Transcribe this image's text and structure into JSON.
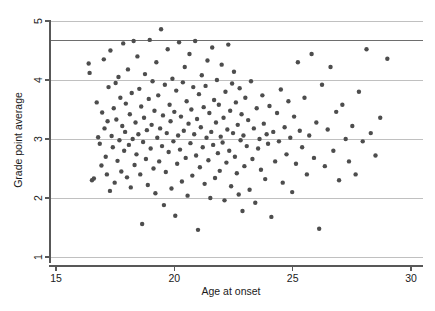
{
  "chart_data": {
    "type": "scatter",
    "title": "",
    "xlabel": "Age at onset",
    "ylabel": "Grade point average",
    "xlim": [
      15,
      30
    ],
    "ylim": [
      1,
      5
    ],
    "xticks": [
      15,
      20,
      25,
      30
    ],
    "yticks": [
      1,
      2,
      3,
      4,
      5
    ],
    "xtick_labels": [
      "15",
      "20",
      "25",
      "30"
    ],
    "ytick_labels": [
      "1",
      "2",
      "3",
      "4",
      "5"
    ],
    "grid": true,
    "grid_axis": "y",
    "legend": "none",
    "marker": "filled-circle",
    "marker_color": "#4d4d4d",
    "marker_size_px": 4.4,
    "reference_lines": [
      {
        "orientation": "horizontal",
        "y": 4.67,
        "color": "#6e6e6e",
        "width": 1.5
      }
    ],
    "series": [
      {
        "name": "students",
        "n_points": 268,
        "points": [
          [
            16.38,
            4.28
          ],
          [
            16.42,
            4.12
          ],
          [
            16.52,
            2.3
          ],
          [
            16.6,
            2.33
          ],
          [
            16.72,
            3.62
          ],
          [
            16.78,
            3.03
          ],
          [
            16.85,
            2.92
          ],
          [
            16.92,
            2.55
          ],
          [
            16.95,
            3.45
          ],
          [
            17.02,
            4.35
          ],
          [
            17.05,
            3.18
          ],
          [
            17.1,
            2.7
          ],
          [
            17.15,
            2.4
          ],
          [
            17.18,
            3.3
          ],
          [
            17.22,
            3.88
          ],
          [
            17.28,
            2.12
          ],
          [
            17.3,
            4.5
          ],
          [
            17.35,
            3.05
          ],
          [
            17.4,
            2.86
          ],
          [
            17.44,
            3.52
          ],
          [
            17.48,
            2.26
          ],
          [
            17.52,
            3.95
          ],
          [
            17.55,
            3.33
          ],
          [
            17.6,
            2.63
          ],
          [
            17.64,
            4.05
          ],
          [
            17.68,
            2.98
          ],
          [
            17.72,
            3.7
          ],
          [
            17.76,
            2.45
          ],
          [
            17.8,
            3.22
          ],
          [
            17.84,
            4.62
          ],
          [
            17.88,
            2.8
          ],
          [
            17.92,
            3.12
          ],
          [
            17.95,
            3.6
          ],
          [
            18.0,
            2.35
          ],
          [
            18.04,
            4.18
          ],
          [
            18.08,
            2.9
          ],
          [
            18.12,
            3.42
          ],
          [
            18.16,
            2.18
          ],
          [
            18.2,
            3.78
          ],
          [
            18.24,
            3.0
          ],
          [
            18.28,
            4.66
          ],
          [
            18.32,
            2.56
          ],
          [
            18.36,
            3.28
          ],
          [
            18.4,
            2.74
          ],
          [
            18.44,
            4.4
          ],
          [
            18.48,
            3.08
          ],
          [
            18.52,
            3.85
          ],
          [
            18.56,
            2.4
          ],
          [
            18.6,
            3.55
          ],
          [
            18.64,
            1.56
          ],
          [
            18.68,
            2.95
          ],
          [
            18.72,
            3.36
          ],
          [
            18.76,
            4.1
          ],
          [
            18.8,
            2.66
          ],
          [
            18.84,
            3.15
          ],
          [
            18.88,
            2.22
          ],
          [
            18.92,
            3.68
          ],
          [
            18.96,
            4.68
          ],
          [
            19.0,
            2.84
          ],
          [
            19.04,
            3.24
          ],
          [
            19.08,
            3.98
          ],
          [
            19.12,
            2.5
          ],
          [
            19.16,
            3.48
          ],
          [
            19.2,
            2.08
          ],
          [
            19.24,
            4.3
          ],
          [
            19.28,
            3.02
          ],
          [
            19.32,
            3.74
          ],
          [
            19.36,
            2.62
          ],
          [
            19.4,
            3.18
          ],
          [
            19.44,
            4.86
          ],
          [
            19.48,
            2.88
          ],
          [
            19.52,
            3.4
          ],
          [
            19.56,
            1.88
          ],
          [
            19.6,
            3.92
          ],
          [
            19.64,
            2.44
          ],
          [
            19.68,
            3.1
          ],
          [
            19.72,
            4.52
          ],
          [
            19.76,
            2.78
          ],
          [
            19.8,
            3.58
          ],
          [
            19.84,
            3.3
          ],
          [
            19.88,
            2.16
          ],
          [
            19.92,
            4.02
          ],
          [
            19.96,
            2.96
          ],
          [
            20.0,
            3.46
          ],
          [
            20.04,
            1.7
          ],
          [
            20.08,
            3.82
          ],
          [
            20.12,
            2.58
          ],
          [
            20.16,
            3.06
          ],
          [
            20.2,
            4.64
          ],
          [
            20.24,
            2.82
          ],
          [
            20.28,
            3.38
          ],
          [
            20.32,
            2.28
          ],
          [
            20.36,
            3.96
          ],
          [
            20.4,
            3.14
          ],
          [
            20.44,
            4.22
          ],
          [
            20.48,
            2.68
          ],
          [
            20.52,
            3.64
          ],
          [
            20.56,
            2.04
          ],
          [
            20.6,
            3.26
          ],
          [
            20.64,
            4.44
          ],
          [
            20.68,
            2.93
          ],
          [
            20.72,
            3.5
          ],
          [
            20.76,
            2.38
          ],
          [
            20.8,
            3.88
          ],
          [
            20.84,
            3.08
          ],
          [
            20.88,
            4.66
          ],
          [
            20.92,
            2.72
          ],
          [
            20.96,
            3.34
          ],
          [
            21.0,
            1.46
          ],
          [
            21.04,
            3.76
          ],
          [
            21.08,
            2.52
          ],
          [
            21.12,
            3.2
          ],
          [
            21.16,
            4.08
          ],
          [
            21.2,
            2.86
          ],
          [
            21.24,
            3.54
          ],
          [
            21.28,
            2.24
          ],
          [
            21.32,
            3.9
          ],
          [
            21.36,
            3.02
          ],
          [
            21.4,
            4.33
          ],
          [
            21.44,
            2.64
          ],
          [
            21.48,
            3.44
          ],
          [
            21.52,
            2.0
          ],
          [
            21.56,
            3.12
          ],
          [
            21.6,
            4.55
          ],
          [
            21.64,
            2.9
          ],
          [
            21.68,
            3.66
          ],
          [
            21.72,
            2.34
          ],
          [
            21.76,
            3.28
          ],
          [
            21.8,
            4.0
          ],
          [
            21.84,
            2.76
          ],
          [
            21.88,
            3.58
          ],
          [
            21.92,
            2.46
          ],
          [
            21.96,
            3.04
          ],
          [
            22.0,
            4.26
          ],
          [
            22.04,
            2.94
          ],
          [
            22.08,
            3.36
          ],
          [
            22.12,
            1.96
          ],
          [
            22.16,
            3.8
          ],
          [
            22.2,
            2.6
          ],
          [
            22.24,
            3.16
          ],
          [
            22.28,
            4.6
          ],
          [
            22.32,
            2.8
          ],
          [
            22.36,
            3.48
          ],
          [
            22.4,
            2.2
          ],
          [
            22.44,
            3.94
          ],
          [
            22.48,
            3.1
          ],
          [
            22.52,
            4.14
          ],
          [
            22.56,
            2.7
          ],
          [
            22.6,
            3.62
          ],
          [
            22.64,
            2.42
          ],
          [
            22.68,
            3.24
          ],
          [
            22.72,
            2.06
          ],
          [
            22.76,
            3.86
          ],
          [
            22.8,
            2.98
          ],
          [
            22.84,
            3.42
          ],
          [
            22.88,
            1.78
          ],
          [
            22.92,
            3.06
          ],
          [
            22.96,
            2.54
          ],
          [
            23.0,
            3.7
          ],
          [
            23.06,
            2.88
          ],
          [
            23.12,
            3.32
          ],
          [
            23.18,
            2.14
          ],
          [
            23.24,
            3.98
          ],
          [
            23.3,
            2.66
          ],
          [
            23.36,
            3.18
          ],
          [
            23.42,
            1.92
          ],
          [
            23.48,
            3.52
          ],
          [
            23.54,
            2.84
          ],
          [
            23.6,
            3.0
          ],
          [
            23.66,
            2.48
          ],
          [
            23.72,
            3.74
          ],
          [
            23.78,
            3.26
          ],
          [
            23.84,
            2.32
          ],
          [
            23.9,
            3.08
          ],
          [
            23.96,
            2.92
          ],
          [
            24.02,
            3.56
          ],
          [
            24.1,
            1.68
          ],
          [
            24.18,
            3.12
          ],
          [
            24.26,
            2.62
          ],
          [
            24.34,
            3.44
          ],
          [
            24.42,
            2.96
          ],
          [
            24.5,
            3.84
          ],
          [
            24.58,
            2.26
          ],
          [
            24.66,
            3.2
          ],
          [
            24.74,
            2.74
          ],
          [
            24.82,
            3.64
          ],
          [
            24.9,
            3.02
          ],
          [
            24.98,
            2.1
          ],
          [
            25.06,
            3.38
          ],
          [
            25.14,
            2.58
          ],
          [
            25.22,
            4.3
          ],
          [
            25.3,
            3.14
          ],
          [
            25.4,
            2.86
          ],
          [
            25.5,
            3.7
          ],
          [
            25.6,
            2.4
          ],
          [
            25.7,
            3.06
          ],
          [
            25.8,
            4.44
          ],
          [
            25.9,
            2.68
          ],
          [
            26.0,
            3.28
          ],
          [
            26.12,
            1.48
          ],
          [
            26.24,
            3.92
          ],
          [
            26.36,
            2.54
          ],
          [
            26.48,
            3.16
          ],
          [
            26.6,
            4.22
          ],
          [
            26.72,
            2.8
          ],
          [
            26.84,
            3.46
          ],
          [
            26.96,
            2.3
          ],
          [
            27.1,
            3.58
          ],
          [
            27.24,
            3.0
          ],
          [
            27.38,
            2.62
          ],
          [
            27.52,
            3.22
          ],
          [
            27.66,
            2.4
          ],
          [
            27.8,
            3.8
          ],
          [
            27.96,
            2.96
          ],
          [
            28.12,
            4.52
          ],
          [
            28.3,
            3.1
          ],
          [
            28.5,
            2.72
          ],
          [
            28.7,
            3.36
          ],
          [
            29.0,
            4.36
          ]
        ]
      }
    ]
  },
  "axes": {
    "x_title": "Age at onset",
    "y_title": "Grade point average"
  }
}
